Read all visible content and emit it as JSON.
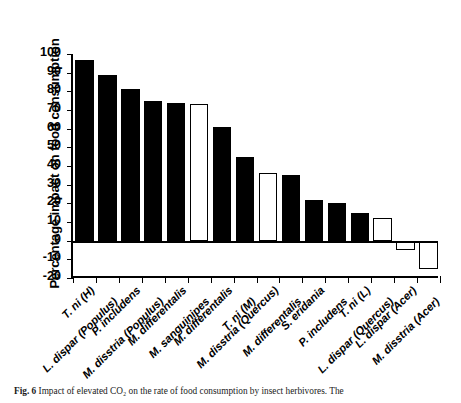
{
  "figure": {
    "caption_label": "Fig. 6",
    "caption_text": "Impact of elevated CO₂ on the rate of food consumption by insect herbivores. The"
  },
  "chart_data": {
    "type": "bar",
    "title": "",
    "xlabel": "",
    "ylabel": "Percentage impact on food consumption",
    "ylim": [
      -20,
      100
    ],
    "yticks": [
      100,
      90,
      80,
      70,
      60,
      50,
      40,
      30,
      20,
      10,
      0,
      -10,
      -20
    ],
    "ytick_labels": [
      "100",
      "90",
      "80",
      "70",
      "60",
      "50",
      "40",
      "30",
      "20",
      "10",
      "0",
      "-10",
      "-20"
    ],
    "grid": false,
    "legend": "none",
    "bar_styles": [
      "filled",
      "filled",
      "filled",
      "filled",
      "filled",
      "open",
      "filled",
      "filled",
      "open",
      "filled",
      "filled",
      "filled",
      "filled",
      "open",
      "open",
      "open"
    ],
    "style_meanings": {
      "filled": "#000000",
      "open": "#ffffff"
    },
    "categories": [
      "T. ni (H)",
      "L. dispar (Populus)",
      "P. includens",
      "M. disstria (Populus)",
      "M. differentalis",
      "M. sanguinipes",
      "M. differentalis",
      "T. ni (M)",
      "M. disstria (Quercus)",
      "M. differentalis",
      "S. eridania",
      "P. includens",
      "T. ni (L)",
      "L. dispar (Quercus)",
      "L. dispar (Acer)",
      "M. disstria (Acer)"
    ],
    "values": [
      97,
      89,
      81,
      75,
      74,
      73,
      61,
      45,
      36,
      35,
      22,
      20,
      15,
      12,
      -5,
      -15
    ],
    "n_bars": 16,
    "n_labels": 14,
    "visible_labels": [
      "T. ni (H)",
      "L. dispar (Populus)",
      "P. includens",
      "M. disstria (Populus)",
      "M. differentalis",
      "M. sanguinipes",
      "M. differentalis",
      "T. ni (M)",
      "M. disstria (Quercus)",
      "M. differentalis",
      "S. eridania",
      "P. includens",
      "T. ni (L)",
      "L. dispar (Quercus)",
      "L. dispar (Acer)",
      "M. disstria (Acer)"
    ]
  }
}
